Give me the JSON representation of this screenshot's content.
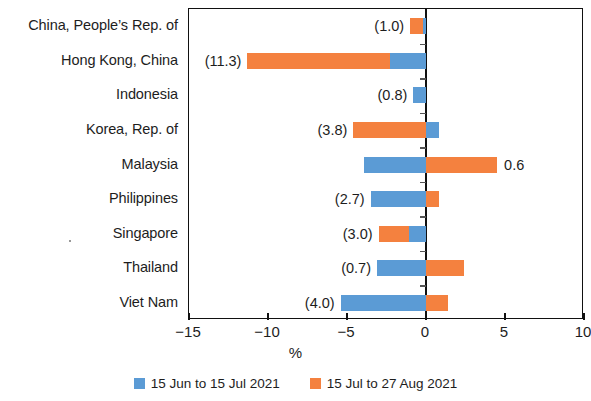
{
  "chart_data": {
    "type": "bar",
    "orientation": "horizontal",
    "stacked": true,
    "title": "",
    "xlabel": "%",
    "ylabel": "",
    "xlim": [
      -15,
      10
    ],
    "xticks": [
      -15,
      -10,
      -5,
      0,
      5,
      10
    ],
    "xticklabels": [
      "−15",
      "−10",
      "−5",
      "0",
      "5",
      "10"
    ],
    "grid": false,
    "legend_position": "bottom",
    "categories": [
      "China, People’s Rep. of",
      "Hong Kong, China",
      "Indonesia",
      "Korea, Rep. of",
      "Malaysia",
      "Philippines",
      "Singapore",
      "Thailand",
      "Viet Nam"
    ],
    "series": [
      {
        "name": "15 Jun to 15 Jul 2021",
        "color": "#5b9bd5",
        "values": [
          -0.2,
          -2.3,
          -0.8,
          0.8,
          -3.9,
          -3.5,
          -1.1,
          -3.1,
          -5.4
        ]
      },
      {
        "name": "15 Jul to 27 Aug 2021",
        "color": "#f4813f",
        "values": [
          -0.8,
          -9.0,
          0.0,
          -4.6,
          4.5,
          0.8,
          -1.9,
          2.4,
          1.4
        ]
      }
    ],
    "total_labels": [
      {
        "category": "China, People’s Rep. of",
        "text": "(1.0)",
        "value": -1.0,
        "side": "left"
      },
      {
        "category": "Hong Kong, China",
        "text": "(11.3)",
        "value": -11.3,
        "side": "left"
      },
      {
        "category": "Indonesia",
        "text": "(0.8)",
        "value": -0.8,
        "side": "left"
      },
      {
        "category": "Korea, Rep. of",
        "text": "(3.8)",
        "value": -3.8,
        "side": "left"
      },
      {
        "category": "Malaysia",
        "text": "0.6",
        "value": 0.6,
        "side": "right"
      },
      {
        "category": "Philippines",
        "text": "(2.7)",
        "value": -2.7,
        "side": "left"
      },
      {
        "category": "Singapore",
        "text": "(3.0)",
        "value": -3.0,
        "side": "left"
      },
      {
        "category": "Thailand",
        "text": "(0.7)",
        "value": -0.7,
        "side": "left"
      },
      {
        "category": "Viet Nam",
        "text": "(4.0)",
        "value": -4.0,
        "side": "left"
      }
    ]
  },
  "axis": {
    "x_title": "%"
  },
  "legend": {
    "items": [
      {
        "label": "15 Jun to 15 Jul 2021",
        "color": "#5b9bd5",
        "swatch": "blue-square-swatch"
      },
      {
        "label": "15 Jul to 27 Aug 2021",
        "color": "#f4813f",
        "swatch": "orange-square-swatch"
      }
    ]
  }
}
